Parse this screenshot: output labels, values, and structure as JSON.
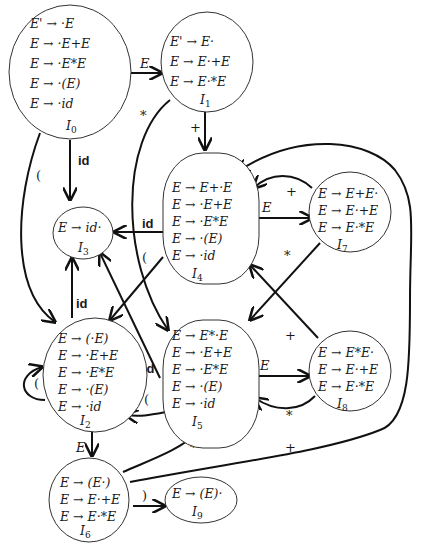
{
  "states": [
    {
      "id": "I0",
      "name": "I_0",
      "items": [
        "E' → ·E",
        "E → ·E+E",
        "E → ·E*E",
        "E → ·(E)",
        "E → ·id"
      ]
    },
    {
      "id": "I1",
      "name": "I_1",
      "items": [
        "E' → E·",
        "E → E·+E",
        "E → E·*E"
      ]
    },
    {
      "id": "I2",
      "name": "I_2",
      "items": [
        "E → (·E)",
        "E → ·E+E",
        "E → ·E*E",
        "E → ·(E)",
        "E → ·id"
      ]
    },
    {
      "id": "I3",
      "name": "I_3",
      "items": [
        "E → id·"
      ]
    },
    {
      "id": "I4",
      "name": "I_4",
      "items": [
        "E → E+·E",
        "E → ·E+E",
        "E → ·E*E",
        "E → ·(E)",
        "E → ·id"
      ]
    },
    {
      "id": "I5",
      "name": "I_5",
      "items": [
        "E → E*·E",
        "E → ·E+E",
        "E → ·E*E",
        "E → ·(E)",
        "E → ·id"
      ]
    },
    {
      "id": "I6",
      "name": "I_6",
      "items": [
        "E → (E·)",
        "E → E·+E",
        "E → E·*E"
      ]
    },
    {
      "id": "I7",
      "name": "I_7",
      "items": [
        "E → E+E·",
        "E → E·+E",
        "E → E·*E"
      ]
    },
    {
      "id": "I8",
      "name": "I_8",
      "items": [
        "E → E*E·",
        "E → E·+E",
        "E → E·*E"
      ]
    },
    {
      "id": "I9",
      "name": "I_9",
      "items": [
        "E → (E)·"
      ]
    }
  ],
  "transitions": [
    {
      "from": "I0",
      "to": "I1",
      "label": "E"
    },
    {
      "from": "I0",
      "to": "I3",
      "label": "id"
    },
    {
      "from": "I0",
      "to": "I2",
      "label": "("
    },
    {
      "from": "I1",
      "to": "I4",
      "label": "+"
    },
    {
      "from": "I1",
      "to": "I5",
      "label": "*"
    },
    {
      "from": "I4",
      "to": "I7",
      "label": "E"
    },
    {
      "from": "I4",
      "to": "I3",
      "label": "id"
    },
    {
      "from": "I4",
      "to": "I2",
      "label": "("
    },
    {
      "from": "I7",
      "to": "I4",
      "label": "+"
    },
    {
      "from": "I7",
      "to": "I5",
      "label": "*"
    },
    {
      "from": "I2",
      "to": "I3",
      "label": "id"
    },
    {
      "from": "I2",
      "to": "I2",
      "label": "("
    },
    {
      "from": "I2",
      "to": "I6",
      "label": "E"
    },
    {
      "from": "I5",
      "to": "I8",
      "label": "E"
    },
    {
      "from": "I5",
      "to": "I3",
      "label": "id"
    },
    {
      "from": "I5",
      "to": "I2",
      "label": "("
    },
    {
      "from": "I8",
      "to": "I5",
      "label": "*"
    },
    {
      "from": "I8",
      "to": "I4",
      "label": "+"
    },
    {
      "from": "I6",
      "to": "I5",
      "label": "*"
    },
    {
      "from": "I6",
      "to": "I4",
      "label": "+"
    },
    {
      "from": "I6",
      "to": "I9",
      "label": ")"
    }
  ],
  "labels": {
    "E": "E",
    "id": "id",
    "lp": "(",
    "rp": ")",
    "plus": "+",
    "star": "*"
  }
}
